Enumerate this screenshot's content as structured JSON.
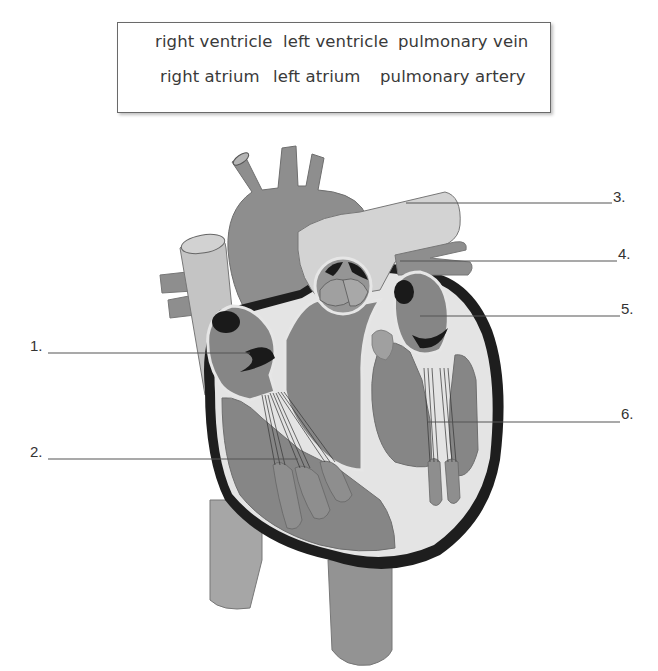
{
  "word_bank": {
    "title": "Word bank",
    "row1": [
      "right ventricle",
      "left ventricle",
      "pulmonary vein"
    ],
    "row2": [
      "right atrium",
      "left atrium",
      "pulmonary artery"
    ]
  },
  "labels": [
    {
      "number": "1.",
      "side": "left"
    },
    {
      "number": "2.",
      "side": "left"
    },
    {
      "number": "3.",
      "side": "right"
    },
    {
      "number": "4.",
      "side": "right"
    },
    {
      "number": "5.",
      "side": "right"
    },
    {
      "number": "6.",
      "side": "right"
    }
  ],
  "diagram": {
    "colors": {
      "muscle": "#8c8c8c",
      "vessel_light": "#c4c4c4",
      "vessel_mid": "#9a9a9a",
      "chamber": "#858585",
      "septum_white": "#e8e8e8",
      "outline_dark": "#1e1e1e",
      "leader_line": "#555555"
    }
  }
}
